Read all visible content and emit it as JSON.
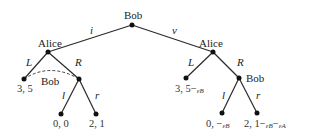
{
  "diagram": {
    "type": "game-tree",
    "root": {
      "player": "Bob"
    },
    "actions_root": {
      "left": "i",
      "right": "v"
    },
    "left_subtree": {
      "player": "Alice",
      "actions": {
        "left": "L",
        "right": "R"
      },
      "info_set_label": "Bob",
      "L_payoff": "3, 5",
      "R_node": {
        "actions": {
          "left": "l",
          "right": "r"
        },
        "l_payoff": "0, 0",
        "r_payoff": "2, 1"
      }
    },
    "right_subtree": {
      "player": "Alice",
      "actions": {
        "left": "L",
        "right": "R"
      },
      "L_payoff_main": "3, 5−",
      "L_payoff_sub": "εB",
      "R_node": {
        "player": "Bob",
        "actions": {
          "left": "l",
          "right": "r"
        },
        "l_payoff_main": "0, −",
        "l_payoff_sub": "εB",
        "r_payoff_main": "2, 1−",
        "r_payoff_sub1": "εB",
        "r_payoff_mid": "−",
        "r_payoff_sub2": "εA"
      }
    }
  }
}
